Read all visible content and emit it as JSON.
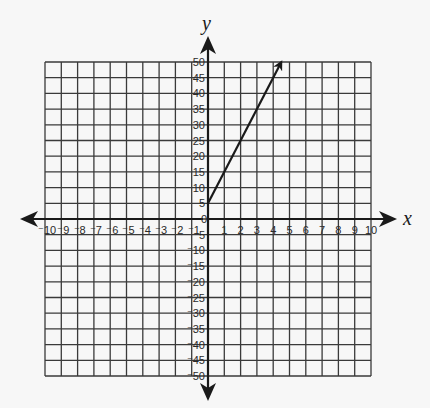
{
  "chart_data": {
    "type": "line",
    "title": "",
    "xlabel": "x",
    "ylabel": "y",
    "xlim": [
      -10,
      10
    ],
    "ylim": [
      -50,
      50
    ],
    "grid": true,
    "x_ticks": [
      "-10",
      "-9",
      "-8",
      "-7",
      "-6",
      "-5",
      "-4",
      "-3",
      "-2",
      "-1",
      "0",
      "1",
      "2",
      "3",
      "4",
      "5",
      "6",
      "7",
      "8",
      "9",
      "10"
    ],
    "y_ticks": [
      "-50",
      "-45",
      "-40",
      "-35",
      "-30",
      "-25",
      "-20",
      "-15",
      "-10",
      "-5",
      "5",
      "10",
      "15",
      "20",
      "25",
      "30",
      "35",
      "40",
      "45",
      "50"
    ],
    "series": [
      {
        "name": "line",
        "equation": "y = 10x + 5",
        "x": [
          0,
          4.5
        ],
        "y": [
          5,
          50
        ],
        "end_arrow": true
      }
    ],
    "colors": {
      "grid": "#3a3a3a",
      "axis": "#1a1a1a",
      "line": "#1a1a1a",
      "background": "#f7f7f7"
    }
  }
}
